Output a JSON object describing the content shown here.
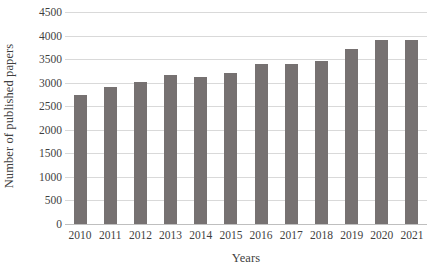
{
  "chart_data": {
    "type": "bar",
    "title": "",
    "xlabel": "Years",
    "ylabel": "Number of published papers",
    "categories": [
      "2010",
      "2011",
      "2012",
      "2013",
      "2014",
      "2015",
      "2016",
      "2017",
      "2018",
      "2019",
      "2020",
      "2021"
    ],
    "values": [
      2720,
      2900,
      3000,
      3150,
      3120,
      3200,
      3380,
      3380,
      3450,
      3700,
      3900,
      3890
    ],
    "series": [
      {
        "name": "Number of published papers",
        "values": [
          2720,
          2900,
          3000,
          3150,
          3120,
          3200,
          3380,
          3380,
          3450,
          3700,
          3900,
          3890
        ]
      }
    ],
    "ylim": [
      0,
      4500
    ],
    "ytick_step": 500,
    "ytick_labels": [
      "0",
      "500",
      "1000",
      "1500",
      "2000",
      "2500",
      "3000",
      "3500",
      "4000",
      "4500"
    ],
    "ytick_values": [
      0,
      500,
      1000,
      1500,
      2000,
      2500,
      3000,
      3500,
      4000,
      4500
    ],
    "grid": true,
    "grid_axis": "y",
    "legend": false,
    "legend_position": "none",
    "bar_color": "#767171",
    "gridline_color": "#d9d9d9",
    "background_color": "#ffffff",
    "text_color": "#3f3f3f"
  }
}
